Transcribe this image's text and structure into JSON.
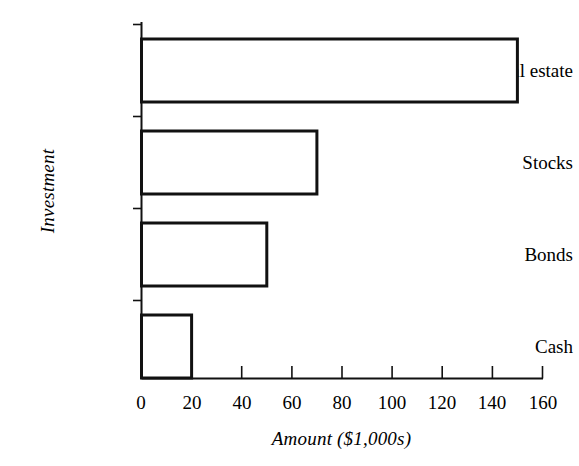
{
  "chart_data": {
    "type": "bar",
    "orientation": "horizontal",
    "title": "",
    "categories": [
      "Real estate",
      "Stocks",
      "Bonds",
      "Cash"
    ],
    "values": [
      150,
      70,
      50,
      20
    ],
    "xlabel": "Amount ($1,000s)",
    "ylabel": "Investment",
    "xlim": [
      0,
      160
    ],
    "xticks": [
      0,
      20,
      40,
      60,
      80,
      100,
      120,
      140,
      160
    ],
    "xtick_labels": [
      "0",
      "20",
      "40",
      "60",
      "80",
      "100",
      "120",
      "140",
      "160"
    ],
    "grid": false,
    "legend": null,
    "bar_fill_color": "#ffffff",
    "bar_edge_color": "#111111",
    "background_color": "#ffffff",
    "series": [
      {
        "name": "Amount",
        "values": [
          150,
          70,
          50,
          20
        ]
      }
    ],
    "points": [
      {
        "category": "Real estate",
        "value": 150
      },
      {
        "category": "Stocks",
        "value": 70
      },
      {
        "category": "Bonds",
        "value": 50
      },
      {
        "category": "Cash",
        "value": 20
      }
    ]
  },
  "axes": {
    "x_axis_name": "amount-axis",
    "y_axis_name": "investment-axis"
  }
}
